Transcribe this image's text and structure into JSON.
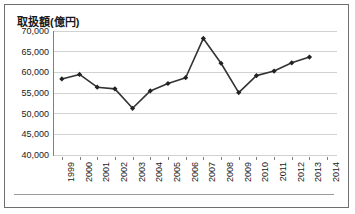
{
  "chart_data": {
    "type": "line",
    "title": "取扱額(億円)",
    "xlabel": "",
    "ylabel": "",
    "categories": [
      "1999",
      "2000",
      "2001",
      "2002",
      "2003",
      "2004",
      "2005",
      "2006",
      "2007",
      "2008",
      "2009",
      "2010",
      "2011",
      "2012",
      "2013",
      "2014"
    ],
    "values": [
      58400,
      59500,
      56400,
      56000,
      51300,
      55500,
      57300,
      58700,
      68200,
      62200,
      55100,
      59200,
      60300,
      62300,
      63700,
      null
    ],
    "series": [
      {
        "name": "取扱額",
        "values": [
          58400,
          59500,
          56400,
          56000,
          51300,
          55500,
          57300,
          58700,
          68200,
          62200,
          55100,
          59200,
          60300,
          62300,
          63700,
          null
        ]
      }
    ],
    "ylim": [
      40000,
      70000
    ],
    "ytick_labels": [
      "70,000",
      "65,000",
      "60,000",
      "55,000",
      "50,000",
      "45,000",
      "40,000"
    ],
    "ytick_values": [
      70000,
      65000,
      60000,
      55000,
      50000,
      45000,
      40000
    ],
    "grid": true,
    "legend": false,
    "legend_position": "none",
    "marker": "filled-diamond",
    "line_color": "#333333",
    "marker_color": "#222222",
    "grid_color": "#d2d2d2",
    "axis_color": "#808080",
    "frame_color": "#6f6f6f",
    "background": "#ffffff"
  }
}
